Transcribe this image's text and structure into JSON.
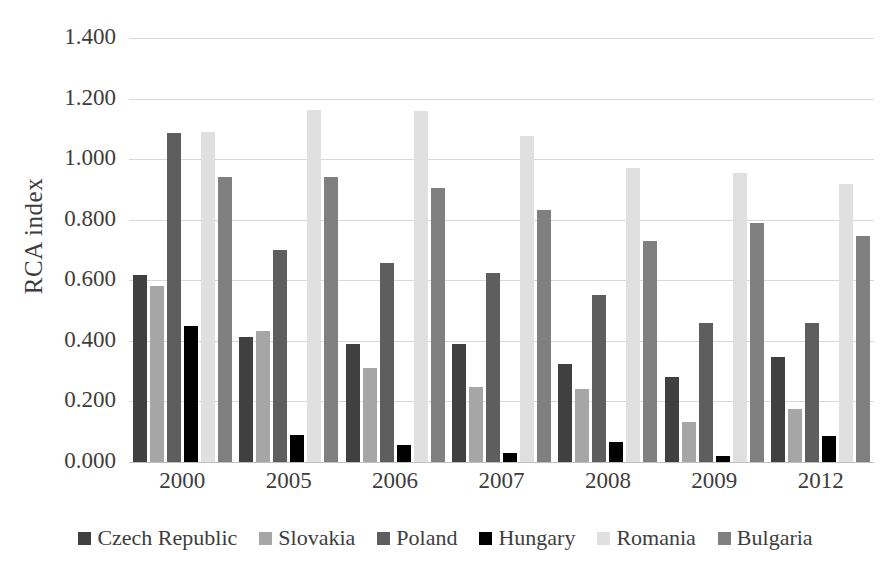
{
  "chart_data": {
    "type": "bar",
    "title": "",
    "xlabel": "",
    "ylabel": "RCA index",
    "ylim": [
      0.0,
      1.4
    ],
    "ytick_labels": [
      "1.400",
      "1.200",
      "1.000",
      "0.800",
      "0.600",
      "0.400",
      "0.200",
      "0.000"
    ],
    "yticks": [
      1.4,
      1.2,
      1.0,
      0.8,
      0.6,
      0.4,
      0.2,
      0.0
    ],
    "grid": true,
    "legend_position": "bottom",
    "categories": [
      "2000",
      "2005",
      "2006",
      "2007",
      "2008",
      "2009",
      "2012"
    ],
    "series": [
      {
        "name": "Czech Republic",
        "color": "#404040",
        "values": [
          0.618,
          0.412,
          0.391,
          0.389,
          0.322,
          0.282,
          0.346
        ]
      },
      {
        "name": "Slovakia",
        "color": "#a6a6a6",
        "values": [
          0.581,
          0.433,
          0.312,
          0.247,
          0.24,
          0.131,
          0.176
        ]
      },
      {
        "name": "Poland",
        "color": "#5e5e5e",
        "values": [
          1.085,
          0.699,
          0.657,
          0.625,
          0.552,
          0.459,
          0.459
        ]
      },
      {
        "name": "Hungary",
        "color": "#000000",
        "values": [
          0.45,
          0.088,
          0.056,
          0.029,
          0.066,
          0.019,
          0.086
        ]
      },
      {
        "name": "Romania",
        "color": "#e0e0e0",
        "values": [
          1.09,
          1.162,
          1.16,
          1.077,
          0.972,
          0.954,
          0.917
        ]
      },
      {
        "name": "Bulgaria",
        "color": "#808080",
        "values": [
          0.941,
          0.94,
          0.906,
          0.832,
          0.731,
          0.789,
          0.746
        ]
      }
    ]
  }
}
